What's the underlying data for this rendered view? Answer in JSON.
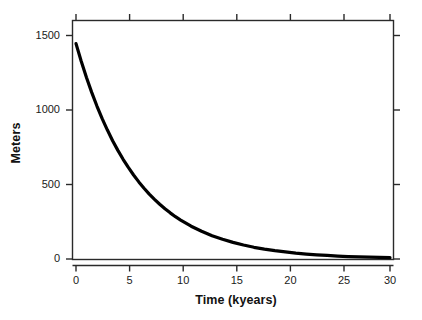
{
  "figure": {
    "background_color": "#ffffff",
    "frame_color": "#222222",
    "line_color": "#000000"
  },
  "chart_data": {
    "type": "line",
    "title": "",
    "xlabel": "Time (kyears)",
    "ylabel": "Meters",
    "xlim": [
      0,
      30
    ],
    "ylim": [
      0,
      1550
    ],
    "xticks": [
      0,
      5,
      10,
      15,
      20,
      25,
      30
    ],
    "yticks": [
      0,
      500,
      1000,
      1500
    ],
    "xticklabels": [
      "0",
      "5",
      "10",
      "15",
      "20",
      "25",
      "30"
    ],
    "yticklabels": [
      "0",
      "500",
      "1000",
      "1500"
    ],
    "grid": false,
    "legend": false,
    "series": [
      {
        "name": "Exponential decay",
        "color": "#000000",
        "linewidth": 3,
        "x": [
          0,
          0.5,
          1,
          1.5,
          2,
          2.5,
          3,
          3.5,
          4,
          4.5,
          5,
          5.5,
          6,
          6.5,
          7,
          7.5,
          8,
          8.5,
          9,
          9.5,
          10,
          11,
          12,
          13,
          14,
          15,
          16,
          17,
          18,
          19,
          20,
          21,
          22,
          23,
          24,
          25,
          26,
          27,
          28,
          29,
          30
        ],
        "values": [
          1400,
          1285,
          1180,
          1083,
          994,
          912,
          838,
          769,
          706,
          648,
          595,
          546,
          501,
          460,
          422,
          388,
          356,
          327,
          300,
          275,
          253,
          213,
          180,
          151,
          128,
          108,
          91,
          76,
          64,
          54,
          46,
          38,
          32,
          27,
          23,
          19,
          16,
          14,
          12,
          10,
          9
        ]
      }
    ]
  }
}
